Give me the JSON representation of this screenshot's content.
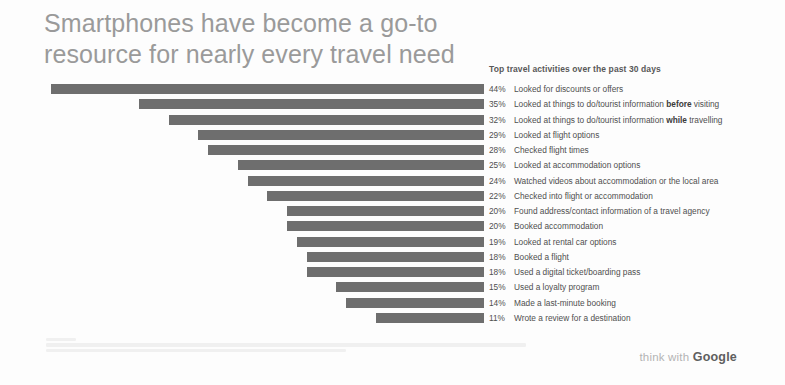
{
  "title": "Smartphones have become a go-to resource for nearly every travel need",
  "legend_heading": "Top travel activities over the past 30 days",
  "brand": {
    "prefix": "think with ",
    "name": "Google"
  },
  "chart_data": {
    "type": "bar",
    "orientation": "horizontal",
    "alignment": "right-aligned",
    "title": "Smartphones have become a go-to resource for nearly every travel need",
    "subtitle": "Top travel activities over the past 30 days",
    "xlabel": "",
    "ylabel": "",
    "xlim": [
      0,
      44
    ],
    "grid": false,
    "legend": "right",
    "value_suffix": "%",
    "bar_color": "#6e6e6e",
    "categories": [
      "Looked for discounts or offers",
      "Looked at things to do/tourist information before visiting",
      "Looked at things to do/tourist information while travelling",
      "Looked at flight options",
      "Checked flight times",
      "Looked at accommodation options",
      "Watched videos about accommodation or the local area",
      "Checked into flight or accommodation",
      "Found address/contact information of a travel agency",
      "Booked accommodation",
      "Looked at rental car options",
      "Booked a flight",
      "Used a digital ticket/boarding pass",
      "Used a loyalty program",
      "Made a last-minute booking",
      "Wrote a review for a destination"
    ],
    "values": [
      44,
      35,
      32,
      29,
      28,
      25,
      24,
      22,
      20,
      20,
      19,
      18,
      18,
      15,
      14,
      11
    ],
    "rows": [
      {
        "value": 44,
        "value_label": "44%",
        "label_html": "Looked for discounts or offers"
      },
      {
        "value": 35,
        "value_label": "35%",
        "label_html": "Looked at things to do/tourist information <b>before</b> visiting"
      },
      {
        "value": 32,
        "value_label": "32%",
        "label_html": "Looked at things to do/tourist information <b>while</b> travelling"
      },
      {
        "value": 29,
        "value_label": "29%",
        "label_html": "Looked at flight options"
      },
      {
        "value": 28,
        "value_label": "28%",
        "label_html": "Checked flight times"
      },
      {
        "value": 25,
        "value_label": "25%",
        "label_html": "Looked at accommodation options"
      },
      {
        "value": 24,
        "value_label": "24%",
        "label_html": "Watched videos about accommodation or the local area"
      },
      {
        "value": 22,
        "value_label": "22%",
        "label_html": "Checked into flight or accommodation"
      },
      {
        "value": 20,
        "value_label": "20%",
        "label_html": "Found address/contact information of a travel agency"
      },
      {
        "value": 20,
        "value_label": "20%",
        "label_html": "Booked accommodation"
      },
      {
        "value": 19,
        "value_label": "19%",
        "label_html": "Looked at rental car options"
      },
      {
        "value": 18,
        "value_label": "18%",
        "label_html": "Booked a flight"
      },
      {
        "value": 18,
        "value_label": "18%",
        "label_html": "Used a digital ticket/boarding pass"
      },
      {
        "value": 15,
        "value_label": "15%",
        "label_html": "Used a loyalty program"
      },
      {
        "value": 14,
        "value_label": "14%",
        "label_html": "Made a last-minute booking"
      },
      {
        "value": 11,
        "value_label": "11%",
        "label_html": "Wrote a review for a destination"
      }
    ]
  }
}
